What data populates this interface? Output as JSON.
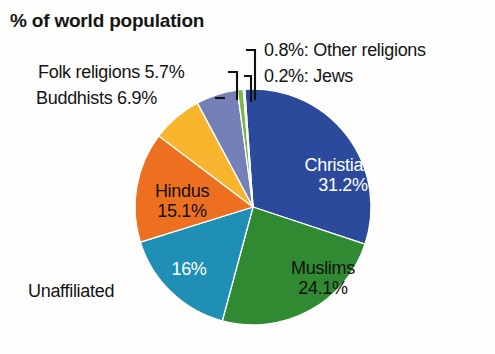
{
  "chart_data": {
    "type": "pie",
    "title": "% of world population",
    "xlabel": "",
    "ylabel": "",
    "categories": [
      "Christians",
      "Muslims",
      "Unaffiliated",
      "Hindus",
      "Buddhists",
      "Folk religions",
      "Other religions",
      "Jews"
    ],
    "values": [
      31.2,
      24.1,
      16,
      15.1,
      6.9,
      5.7,
      0.8,
      0.2
    ],
    "value_labels": [
      "31.2%",
      "24.1%",
      "16%",
      "15.1%",
      "6.9%",
      "5.7%",
      "0.8%",
      "0.2%"
    ],
    "colors": [
      "#2b4a9b",
      "#2f8a32",
      "#1f8fb5",
      "#ed7020",
      "#f7b52e",
      "#7680b8",
      "#7ab648",
      "#a8c8e0"
    ],
    "legend": "none",
    "grid": false,
    "start_angle_deg": -4,
    "direction": "clockwise",
    "slices": [
      {
        "name": "Christians",
        "value": 31.2,
        "value_label": "31.2%",
        "color": "#2b4a9b",
        "label_placement": "inside",
        "label_color": "white"
      },
      {
        "name": "Muslims",
        "value": 24.1,
        "value_label": "24.1%",
        "color": "#2f8a32",
        "label_placement": "inside",
        "label_color": "black"
      },
      {
        "name": "Unaffiliated",
        "value": 16,
        "value_label": "16%",
        "color": "#1f8fb5",
        "label_placement": "split",
        "label_color": "white"
      },
      {
        "name": "Hindus",
        "value": 15.1,
        "value_label": "15.1%",
        "color": "#ed7020",
        "label_placement": "inside",
        "label_color": "black"
      },
      {
        "name": "Buddhists",
        "value": 6.9,
        "value_label": "6.9%",
        "color": "#f7b52e",
        "label_placement": "outside",
        "label_color": "black"
      },
      {
        "name": "Folk religions",
        "value": 5.7,
        "value_label": "5.7%",
        "color": "#7680b8",
        "label_placement": "outside",
        "label_color": "black"
      },
      {
        "name": "Other religions",
        "value": 0.8,
        "value_label": "0.8%",
        "color": "#7ab648",
        "label_placement": "outside",
        "label_color": "black"
      },
      {
        "name": "Jews",
        "value": 0.2,
        "value_label": "0.2%",
        "color": "#a8c8e0",
        "label_placement": "outside",
        "label_color": "black"
      }
    ]
  },
  "title": "% of world population",
  "labels": {
    "folk_religions": "Folk religions 5.7%",
    "buddhists": "Buddhists 6.9%",
    "other_religions": "0.8%: Other religions",
    "jews": "0.2%: Jews",
    "unaffiliated": "Unaffiliated",
    "christians_name": "Christians",
    "christians_value": "31.2%",
    "muslims_name": "Muslims",
    "muslims_value": "24.1%",
    "hindus_name": "Hindus",
    "hindus_value": "15.1%",
    "sixteen_percent": "16%"
  }
}
